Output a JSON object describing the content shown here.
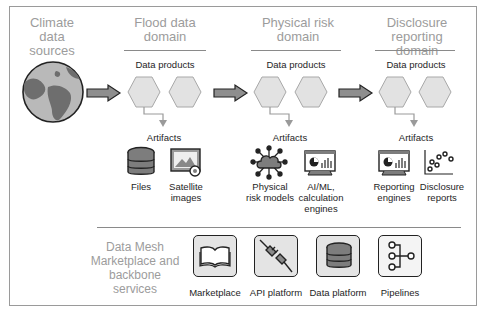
{
  "diagram": {
    "source": {
      "title": "Climate data sources",
      "icon": "globe-icon"
    },
    "domains": [
      {
        "title": "Flood data domain",
        "data_products_label": "Data products",
        "artifacts_label": "Artifacts",
        "artifacts": [
          {
            "label": "Files",
            "icon": "database-icon"
          },
          {
            "label": "Satellite images",
            "icon": "satellite-image-icon"
          }
        ]
      },
      {
        "title": "Physical risk domain",
        "data_products_label": "Data products",
        "artifacts_label": "Artifacts",
        "artifacts": [
          {
            "label": "Physical risk models",
            "icon": "cloud-network-icon"
          },
          {
            "label": "AI/ML, calculation engines",
            "icon": "dashboard-monitor-icon"
          }
        ]
      },
      {
        "title": "Disclosure reporting domain",
        "data_products_label": "Data products",
        "artifacts_label": "Artifacts",
        "artifacts": [
          {
            "label": "Reporting engines",
            "icon": "dashboard-monitor-icon"
          },
          {
            "label": "Disclosure reports",
            "icon": "scatter-plot-icon"
          }
        ]
      }
    ],
    "backbone": {
      "title": "Data Mesh Marketplace and backbone services",
      "services": [
        {
          "label": "Marketplace",
          "icon": "open-book-icon"
        },
        {
          "label": "API platform",
          "icon": "plug-connector-icon"
        },
        {
          "label": "Data platform",
          "icon": "database-icon"
        },
        {
          "label": "Pipelines",
          "icon": "pipeline-icon"
        }
      ]
    },
    "colors": {
      "title_gray": "#9c9c9c",
      "hexagon_fill": "#e2e2e2",
      "hexagon_stroke": "#a8a8a8",
      "arrow_fill": "#8e8e8e",
      "icon_dark": "#2a2a2a",
      "icon_mid": "#7d7d7d"
    }
  }
}
